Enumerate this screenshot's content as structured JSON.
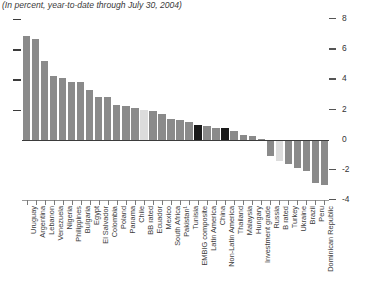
{
  "subtitle": "(In percent, year-to-date through July 30, 2004)",
  "colors": {
    "bar_default": "#8a8a8a",
    "bar_highlight_black": "#1a1a1a",
    "bar_highlight_light": "#dcdcdc",
    "axis": "#3b3b3b",
    "text": "#3c3c3c"
  },
  "axis": {
    "right_ticks": [
      "8",
      "6",
      "4",
      "2",
      "0",
      "-2",
      "-4"
    ],
    "left_dash_values": [
      8,
      6,
      4,
      2
    ]
  },
  "chart_data": {
    "type": "bar",
    "title": "",
    "subtitle": "(In percent, year-to-date through July 30, 2004)",
    "xlabel": "",
    "ylabel": "",
    "ylim": [
      -4,
      8
    ],
    "yticks": [
      8,
      6,
      4,
      2,
      0,
      -2,
      -4
    ],
    "grid": false,
    "legend": "none",
    "orientation": "vertical",
    "categories": [
      "Uruguay",
      "Argentina",
      "Lebanon",
      "Venezuela",
      "Nigeria",
      "Philippines",
      "Bulgaria",
      "Egypt",
      "El Salvador",
      "Colombia",
      "Poland",
      "Panama",
      "Chile",
      "BB rated",
      "Ecuador",
      "Mexico",
      "South Africa",
      "Pakistan¹",
      "Tunisia",
      "EMBIG composite",
      "Latin America",
      "China",
      "Non-Latin America",
      "Thailand",
      "Malaysia",
      "Hungary",
      "Investment grade",
      "Russia",
      "B rated",
      "Turkey",
      "Ukraine",
      "Brazil",
      "Peru",
      "Dominican Republic"
    ],
    "values": [
      6.9,
      6.7,
      5.2,
      4.2,
      4.1,
      3.8,
      3.8,
      3.3,
      2.8,
      2.8,
      2.3,
      2.2,
      2.1,
      2.0,
      1.9,
      1.7,
      1.4,
      1.3,
      1.2,
      0.95,
      0.9,
      0.8,
      0.8,
      0.55,
      0.3,
      0.25,
      0.05,
      -1.1,
      -1.4,
      -1.6,
      -1.9,
      -2.1,
      -2.9,
      -3.0
    ],
    "bar_styles": [
      "default",
      "default",
      "default",
      "default",
      "default",
      "default",
      "default",
      "default",
      "default",
      "default",
      "default",
      "default",
      "default",
      "light",
      "default",
      "default",
      "default",
      "default",
      "default",
      "black",
      "default",
      "default",
      "black",
      "default",
      "default",
      "default",
      "default",
      "default",
      "light",
      "default",
      "default",
      "default",
      "default",
      "default"
    ]
  }
}
